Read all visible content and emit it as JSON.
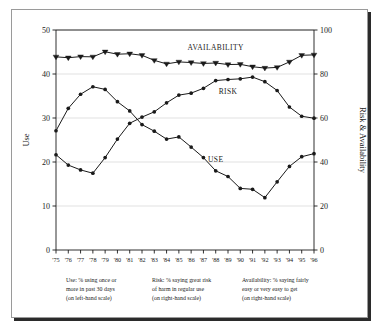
{
  "figure": {
    "background_color": "#ffffff",
    "frame_color": "#9a9a9a",
    "shadow_color": "#2b2b2b",
    "ink_color": "#1a1a1a",
    "grid_color": "#cfcfcf"
  },
  "axes": {
    "left_title": "Use",
    "right_title": "Risk & Availability",
    "left_ticks": [
      "0",
      "10",
      "20",
      "30",
      "40",
      "50"
    ],
    "right_ticks": [
      "0",
      "20",
      "40",
      "60",
      "80",
      "100"
    ]
  },
  "series_labels": {
    "availability": "AVAILABILITY",
    "risk": "RISK",
    "use": "USE"
  },
  "notes": [
    {
      "name": "use-note",
      "lines": [
        "Use:  % using once or",
        "more in past 30 days",
        "(on left-hand scale)"
      ]
    },
    {
      "name": "risk-note",
      "lines": [
        "Risk:  % saying great risk",
        "of harm in regular use",
        "(on right-hand scale)"
      ]
    },
    {
      "name": "availability-note",
      "lines": [
        "Availability:  % saying fairly",
        "easy or very easy to get",
        "(on right-hand scale)"
      ]
    }
  ],
  "chart_data": {
    "type": "line",
    "title": "",
    "xlabel": "",
    "ylabel": "Use",
    "y2label": "Risk & Availability",
    "grid": true,
    "legend": "inline-annotations",
    "x": [
      "'75",
      "'76",
      "'77",
      "'78",
      "'79",
      "'80",
      "'81",
      "'82",
      "'83",
      "'84",
      "'85",
      "'86",
      "'87",
      "'88",
      "'89",
      "'90",
      "'91",
      "'92",
      "'93",
      "'94",
      "'95",
      "'96"
    ],
    "categories": [
      "'75",
      "'76",
      "'77",
      "'78",
      "'79",
      "'80",
      "'81",
      "'82",
      "'83",
      "'84",
      "'85",
      "'86",
      "'87",
      "'88",
      "'89",
      "'90",
      "'91",
      "'92",
      "'93",
      "'94",
      "'95",
      "'96"
    ],
    "ylim": [
      0,
      50
    ],
    "y2lim": [
      0,
      100
    ],
    "yticks": [
      0,
      10,
      20,
      30,
      40,
      50
    ],
    "y2ticks": [
      0,
      20,
      40,
      60,
      80,
      100
    ],
    "series": [
      {
        "name": "USE",
        "axis": "left",
        "marker": "circle",
        "values": [
          27.1,
          32.2,
          35.4,
          37.1,
          36.5,
          33.7,
          31.6,
          28.5,
          27.0,
          25.2,
          25.7,
          23.4,
          21.0,
          18.0,
          16.7,
          14.0,
          13.8,
          11.9,
          15.5,
          19.0,
          21.2,
          21.9
        ]
      },
      {
        "name": "RISK",
        "axis": "right",
        "marker": "circle",
        "values": [
          43.3,
          38.6,
          36.4,
          34.9,
          42.0,
          50.4,
          57.6,
          60.4,
          62.8,
          66.9,
          70.4,
          71.3,
          73.5,
          77.0,
          77.5,
          77.8,
          78.6,
          76.5,
          72.5,
          65.0,
          60.8,
          59.9
        ]
      },
      {
        "name": "AVAILABILITY",
        "axis": "right",
        "marker": "triangle-down",
        "values": [
          87.8,
          87.4,
          87.9,
          87.8,
          90.1,
          89.0,
          89.2,
          88.5,
          86.2,
          84.6,
          85.5,
          85.2,
          84.8,
          85.0,
          84.3,
          84.4,
          83.3,
          82.7,
          83.0,
          85.5,
          88.5,
          88.7
        ]
      }
    ],
    "annotations": [
      {
        "text": "AVAILABILITY",
        "x": "'88",
        "y2": 91
      },
      {
        "text": "RISK",
        "x": "'89",
        "y2": 71
      },
      {
        "text": "USE",
        "x": "'88",
        "y": 20
      }
    ]
  }
}
